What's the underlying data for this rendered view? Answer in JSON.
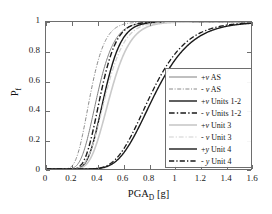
{
  "chart_data": {
    "type": "line",
    "title": "",
    "xlabel": "PGA_D [g]",
    "ylabel": "P_f",
    "xlim": [
      0,
      1.6
    ],
    "ylim": [
      0,
      1
    ],
    "xticks": [
      "0",
      "0.2",
      "0.4",
      "0.6",
      "0.8",
      "1",
      "1.2",
      "1.4",
      "1.6"
    ],
    "xtick_values": [
      0,
      0.2,
      0.4,
      0.6,
      0.8,
      1.0,
      1.2,
      1.4,
      1.6
    ],
    "yticks": [
      "0",
      "0.2",
      "0.4",
      "0.6",
      "0.8",
      "1"
    ],
    "ytick_values": [
      0,
      0.2,
      0.4,
      0.6,
      0.8,
      1.0
    ],
    "grid": false,
    "legend_position": "lower-right",
    "series": [
      {
        "name": "+v AS",
        "median": 0.4,
        "beta": 0.26,
        "color": "#808080",
        "dash": "solid",
        "width": 1.0
      },
      {
        "name": "- v AS",
        "median": 0.345,
        "beta": 0.26,
        "color": "#8a8a8a",
        "dash": "dashdot",
        "width": 1.0
      },
      {
        "name": "+v Units 1-2",
        "median": 0.455,
        "beta": 0.23,
        "color": "#1a1a1a",
        "dash": "solid",
        "width": 1.4
      },
      {
        "name": "- v Units 1-2",
        "median": 0.425,
        "beta": 0.23,
        "color": "#1a1a1a",
        "dash": "dashdot",
        "width": 1.4
      },
      {
        "name": "+v Unit 3",
        "median": 0.5,
        "beta": 0.25,
        "color": "#c9c9c9",
        "dash": "solid",
        "width": 1.6
      },
      {
        "name": "- v Unit 3",
        "median": 0.465,
        "beta": 0.25,
        "color": "#cfcfcf",
        "dash": "dashdot",
        "width": 1.2
      },
      {
        "name": "+y Unit 4",
        "median": 0.845,
        "beta": 0.27,
        "color": "#1a1a1a",
        "dash": "solid",
        "width": 1.4
      },
      {
        "name": "- y Unit 4",
        "median": 0.815,
        "beta": 0.27,
        "color": "#1a1a1a",
        "dash": "dashdot",
        "width": 1.3
      }
    ]
  },
  "axes": {
    "x_title_main": "PGA",
    "x_title_sub": "D",
    "x_title_unit": " [g]",
    "y_title_main": "P",
    "y_title_sub": "f"
  },
  "legend": {
    "items": [
      {
        "label_sign": "+",
        "label_v": "v",
        "label_rest": " AS"
      },
      {
        "label_sign": "- ",
        "label_v": "v",
        "label_rest": " AS"
      },
      {
        "label_sign": "+",
        "label_v": "v",
        "label_rest": " Units 1-2"
      },
      {
        "label_sign": "- ",
        "label_v": "v",
        "label_rest": " Units 1-2"
      },
      {
        "label_sign": "+",
        "label_v": "v",
        "label_rest": " Unit 3"
      },
      {
        "label_sign": "- ",
        "label_v": "v",
        "label_rest": " Unit 3"
      },
      {
        "label_sign": "+",
        "label_v": "y",
        "label_rest": " Unit 4"
      },
      {
        "label_sign": "- ",
        "label_v": "y",
        "label_rest": " Unit 4"
      }
    ]
  },
  "colors": {
    "frame": "#6e6e6e",
    "text": "#1a1a1a",
    "background": "#ffffff"
  }
}
